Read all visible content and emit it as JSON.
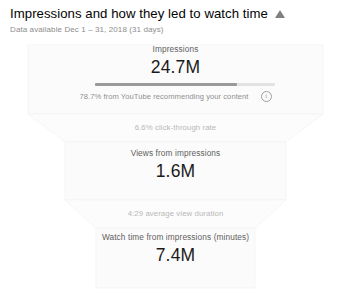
{
  "header": {
    "title": "Impressions and how they led to watch time",
    "collapse_icon": "triangle-up-icon",
    "subtitle": "Data available Dec 1 – 31, 2018 (31 days)"
  },
  "chart_data": {
    "type": "bar",
    "title": "Impressions and how they led to watch time",
    "subtitle": "Data available Dec 1 – 31, 2018 (31 days)",
    "categories": [
      "Impressions",
      "Views from impressions",
      "Watch time from impressions (minutes)"
    ],
    "values": [
      24700000,
      1600000,
      7400000
    ],
    "value_labels": [
      "24.7M",
      "1.6M",
      "7.4M"
    ],
    "xlabel": "",
    "ylabel": "",
    "grid": false,
    "legend": false,
    "stages": [
      {
        "label": "Impressions",
        "value": "24.7M",
        "bar": {
          "fill_percent": 78.7,
          "fill_color": "#9a9a9a",
          "track_color": "#e3e3e3"
        },
        "note": "78.7% from YouTube recommending your content",
        "note_icon": "info-icon"
      },
      {
        "label": "Views from impressions",
        "value": "1.6M"
      },
      {
        "label": "Watch time from impressions (minutes)",
        "value": "7.4M"
      }
    ],
    "transitions": [
      {
        "label": "6.6% click-through rate"
      },
      {
        "label": "4:29 average view duration"
      }
    ],
    "funnel_color": "#fbfbfb",
    "funnel_edge_color": "#f0f0f0"
  }
}
